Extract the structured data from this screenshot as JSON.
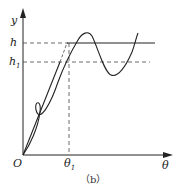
{
  "diagram": {
    "caption": "（b）",
    "axes": {
      "y_label": "y",
      "x_label": "θ",
      "origin_label": "O"
    },
    "levels": {
      "h_label": "h",
      "h1_label_base": "h",
      "h1_label_sub": "1"
    },
    "ticks": {
      "theta1_label_base": "θ",
      "theta1_label_sub": "1"
    },
    "curves": [
      {
        "name": "step-response-ideal",
        "style": "solid",
        "description": "straight ramp from O to h at θ1 then flat"
      },
      {
        "name": "ramp-line",
        "style": "solid",
        "description": "straight line from O rising through h1"
      },
      {
        "name": "oscillating-response",
        "style": "solid",
        "description": "curve overshooting h, dipping below h1, then rising"
      }
    ],
    "colors": {
      "line": "#222222",
      "background": "#ffffff"
    }
  }
}
